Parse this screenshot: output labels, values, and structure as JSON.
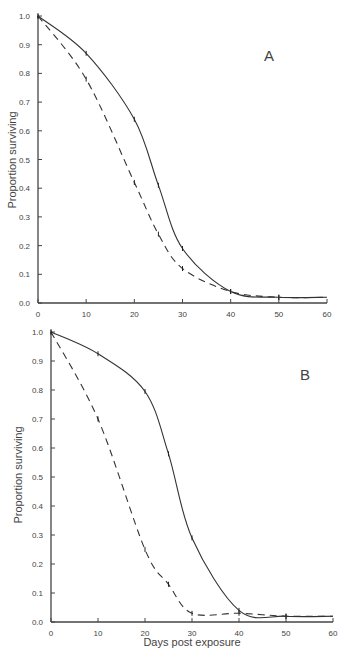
{
  "chart_data": [
    {
      "type": "line",
      "panel_label": "A",
      "xlabel": "",
      "ylabel": "Proportion surviving",
      "xlim": [
        0,
        60
      ],
      "ylim": [
        0,
        1.0
      ],
      "xticks": [
        "0",
        "10",
        "20",
        "30",
        "40",
        "50",
        "60"
      ],
      "yticks": [
        "0.0",
        "0.1",
        "0.2",
        "0.3",
        "0.4",
        "0.5",
        "0.6",
        "0.7",
        "0.8",
        "0.9",
        "1.0"
      ],
      "grid": false,
      "series": [
        {
          "name": "solid",
          "style": "solid",
          "x": [
            0,
            10,
            20,
            25,
            30,
            40,
            50
          ],
          "values": [
            1.0,
            0.87,
            0.64,
            0.41,
            0.19,
            0.04,
            0.02
          ]
        },
        {
          "name": "dashed",
          "style": "dashed",
          "x": [
            0,
            10,
            20,
            25,
            30,
            40,
            50
          ],
          "values": [
            1.0,
            0.78,
            0.42,
            0.24,
            0.12,
            0.04,
            0.02
          ]
        }
      ]
    },
    {
      "type": "line",
      "panel_label": "B",
      "xlabel": "Days post exposure",
      "ylabel": "Proportion surviving",
      "xlim": [
        0,
        60
      ],
      "ylim": [
        0,
        1.0
      ],
      "xticks": [
        "0",
        "10",
        "20",
        "30",
        "40",
        "50",
        "60"
      ],
      "yticks": [
        "0.0",
        "0.1",
        "0.2",
        "0.3",
        "0.4",
        "0.5",
        "0.6",
        "0.7",
        "0.8",
        "0.9",
        "1.0"
      ],
      "grid": false,
      "series": [
        {
          "name": "solid",
          "style": "solid",
          "x": [
            0,
            10,
            20,
            25,
            30,
            40,
            50
          ],
          "values": [
            1.0,
            0.925,
            0.795,
            0.58,
            0.29,
            0.04,
            0.02
          ]
        },
        {
          "name": "dashed",
          "style": "dashed",
          "x": [
            0,
            10,
            20,
            25,
            30,
            40,
            50
          ],
          "values": [
            1.0,
            0.7,
            0.25,
            0.13,
            0.03,
            0.03,
            0.02
          ]
        }
      ]
    }
  ]
}
